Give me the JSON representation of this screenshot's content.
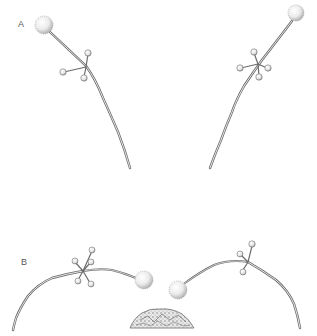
{
  "figure": {
    "panels": [
      {
        "id": "A",
        "label": "A"
      },
      {
        "id": "B",
        "label": "B"
      }
    ],
    "colors": {
      "stroke": "#6b6b6b",
      "stroke_light": "#a8a8a8",
      "sphere_fill": "#f2f2f2",
      "sphere_shade": "#bdbdbd",
      "background": "#ffffff"
    }
  }
}
